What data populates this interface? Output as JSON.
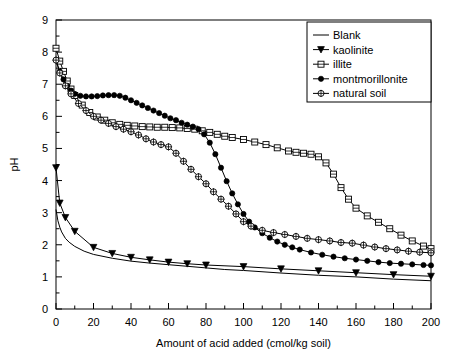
{
  "chart_data": {
    "type": "line",
    "title": "",
    "xlabel": "Amount of acid added (cmol/kg soil)",
    "ylabel": "pH",
    "xlim": [
      0,
      200
    ],
    "ylim": [
      0,
      9
    ],
    "xticks": [
      0,
      20,
      40,
      60,
      80,
      100,
      120,
      140,
      160,
      180,
      200
    ],
    "yticks": [
      0,
      1,
      2,
      3,
      4,
      5,
      6,
      7,
      8,
      9
    ],
    "x_minor_tick_step": 10,
    "y_minor_tick_step": 0.5,
    "grid": false,
    "legend_position": "top-right",
    "legend_entries": [
      "Blank",
      "kaolinite",
      "illite",
      "montmorillonite",
      "natural soil"
    ],
    "series": [
      {
        "name": "Blank",
        "marker": "none",
        "x": [
          0,
          1,
          2,
          3,
          5,
          7,
          10,
          15,
          20,
          30,
          40,
          50,
          60,
          70,
          80,
          90,
          100,
          120,
          140,
          160,
          180,
          200
        ],
        "values": [
          3.1,
          2.75,
          2.55,
          2.4,
          2.2,
          2.08,
          1.95,
          1.8,
          1.7,
          1.58,
          1.49,
          1.43,
          1.38,
          1.33,
          1.28,
          1.23,
          1.2,
          1.12,
          1.05,
          1.0,
          0.93,
          0.88
        ]
      },
      {
        "name": "kaolinite",
        "marker": "triangle-down-filled",
        "x": [
          0,
          2,
          5,
          10,
          20,
          30,
          40,
          50,
          60,
          70,
          80,
          100,
          120,
          140,
          160,
          180,
          200
        ],
        "values": [
          4.4,
          3.3,
          2.85,
          2.42,
          1.92,
          1.73,
          1.61,
          1.53,
          1.46,
          1.41,
          1.37,
          1.32,
          1.25,
          1.19,
          1.13,
          1.07,
          1.02
        ]
      },
      {
        "name": "illite",
        "marker": "square-open",
        "x": [
          0,
          2,
          4,
          6,
          8,
          10,
          14,
          18,
          22,
          26,
          30,
          34,
          38,
          42,
          46,
          50,
          54,
          58,
          62,
          66,
          70,
          74,
          78,
          82,
          86,
          90,
          94,
          100,
          106,
          112,
          118,
          124,
          128,
          132,
          136,
          140,
          144,
          148,
          152,
          156,
          160,
          166,
          172,
          178,
          184,
          190,
          196,
          200
        ],
        "values": [
          8.12,
          7.72,
          7.4,
          7.1,
          6.85,
          6.65,
          6.35,
          6.12,
          5.98,
          5.88,
          5.8,
          5.75,
          5.72,
          5.7,
          5.68,
          5.67,
          5.66,
          5.66,
          5.65,
          5.64,
          5.62,
          5.6,
          5.55,
          5.5,
          5.44,
          5.38,
          5.34,
          5.28,
          5.2,
          5.12,
          5.02,
          4.92,
          4.88,
          4.85,
          4.82,
          4.74,
          4.55,
          4.2,
          3.78,
          3.42,
          3.14,
          2.9,
          2.7,
          2.5,
          2.3,
          2.12,
          1.96,
          1.88
        ]
      },
      {
        "name": "montmorillonite",
        "marker": "circle-filled",
        "x": [
          0,
          2,
          4,
          6,
          8,
          10,
          13,
          16,
          19,
          22,
          25,
          28,
          31,
          34,
          37,
          40,
          43,
          46,
          49,
          52,
          55,
          58,
          61,
          64,
          67,
          70,
          73,
          76,
          79,
          82,
          85,
          88,
          91,
          94,
          97,
          100,
          103,
          106,
          110,
          114,
          118,
          122,
          126,
          130,
          136,
          142,
          148,
          154,
          160,
          166,
          172,
          178,
          184,
          190,
          196,
          200
        ],
        "values": [
          7.75,
          7.4,
          7.15,
          6.95,
          6.8,
          6.7,
          6.64,
          6.62,
          6.62,
          6.63,
          6.65,
          6.66,
          6.66,
          6.64,
          6.58,
          6.5,
          6.42,
          6.34,
          6.26,
          6.18,
          6.1,
          6.02,
          5.94,
          5.88,
          5.8,
          5.74,
          5.68,
          5.6,
          5.44,
          5.18,
          4.82,
          4.4,
          3.98,
          3.6,
          3.26,
          2.96,
          2.72,
          2.54,
          2.36,
          2.22,
          2.1,
          2.0,
          1.92,
          1.85,
          1.76,
          1.69,
          1.63,
          1.58,
          1.54,
          1.5,
          1.46,
          1.43,
          1.41,
          1.39,
          1.37,
          1.36
        ]
      },
      {
        "name": "natural soil",
        "marker": "circle-cross-open",
        "x": [
          0,
          2,
          5,
          8,
          12,
          16,
          20,
          24,
          28,
          32,
          36,
          40,
          44,
          48,
          52,
          56,
          60,
          64,
          68,
          72,
          76,
          80,
          84,
          88,
          92,
          96,
          100,
          104,
          110,
          116,
          122,
          128,
          134,
          140,
          146,
          152,
          158,
          164,
          170,
          176,
          182,
          188,
          194,
          200
        ],
        "values": [
          7.75,
          7.35,
          6.95,
          6.7,
          6.4,
          6.18,
          6.0,
          5.88,
          5.78,
          5.68,
          5.6,
          5.52,
          5.42,
          5.3,
          5.2,
          5.12,
          5.05,
          4.85,
          4.6,
          4.35,
          4.12,
          3.9,
          3.65,
          3.42,
          3.2,
          2.96,
          2.72,
          2.58,
          2.45,
          2.38,
          2.32,
          2.26,
          2.2,
          2.16,
          2.12,
          2.07,
          2.05,
          1.99,
          1.93,
          1.88,
          1.84,
          1.8,
          1.77,
          1.75
        ]
      }
    ]
  }
}
